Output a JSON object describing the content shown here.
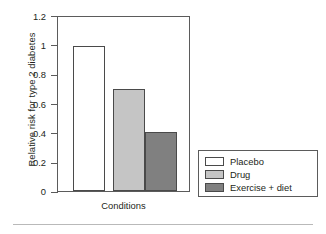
{
  "chart_data": {
    "type": "bar",
    "title": "",
    "categories": [
      "Placebo",
      "Drug",
      "Exercise + diet"
    ],
    "values": [
      1.0,
      0.7,
      0.41
    ],
    "xlabel": "Conditions",
    "ylabel": "Relative risk for type 2 diabetes",
    "ylim": [
      0,
      1.2
    ],
    "yticks": [
      "0",
      "0.2",
      "0.4",
      "0.6",
      "0.8",
      "1",
      "1.2"
    ],
    "ytick_values": [
      0,
      0.2,
      0.4,
      0.6,
      0.8,
      1,
      1.2
    ],
    "xticks": [],
    "grid": false,
    "legend_position": "right-bottom-outside",
    "series": [
      {
        "name": "Placebo",
        "value": 1.0,
        "color": "#ffffff",
        "edge_color": "#4a4a4a"
      },
      {
        "name": "Drug",
        "value": 0.7,
        "color": "#c5c5c5",
        "edge_color": "#4a4a4a"
      },
      {
        "name": "Exercise + diet",
        "value": 0.41,
        "color": "#808080",
        "edge_color": "#4a4a4a"
      }
    ]
  },
  "legend": {
    "items": [
      {
        "label": "Placebo",
        "color": "#ffffff"
      },
      {
        "label": "Drug",
        "color": "#c5c5c5"
      },
      {
        "label": "Exercise + diet",
        "color": "#808080"
      }
    ]
  },
  "axes": {
    "y_title": "Relative risk for type 2 diabetes",
    "x_title": "Conditions",
    "y_tick_labels": [
      "1.2",
      "1",
      "0.8",
      "0.6",
      "0.4",
      "0.2",
      "0"
    ]
  },
  "colors": {
    "axis": "#5b5b5b",
    "text": "#231f20",
    "bar_edge": "#4a4a4a",
    "rule": "#b9b9b9"
  }
}
